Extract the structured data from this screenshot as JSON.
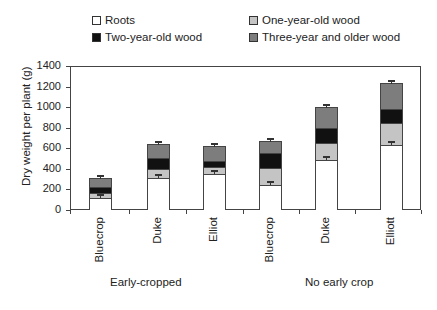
{
  "legend": {
    "items": [
      {
        "label": "Roots",
        "color": "#ffffff"
      },
      {
        "label": "One-year-old wood",
        "color": "#c4c4c4"
      },
      {
        "label": "Two-year-old wood",
        "color": "#111111"
      },
      {
        "label": "Three-year and older wood",
        "color": "#7d7d7d"
      }
    ]
  },
  "axis": {
    "ylabel": "Dry weight per plant (g)",
    "yticks": [
      "0",
      "200",
      "400",
      "600",
      "800",
      "1000",
      "1200",
      "1400"
    ]
  },
  "groups": [
    {
      "label": "Early-cropped"
    },
    {
      "label": "No early crop"
    }
  ],
  "categories": [
    "Bluecrop",
    "Duke",
    "Elliot",
    "Bluecrop",
    "Duke",
    "Elliott"
  ],
  "chart_data": {
    "type": "bar",
    "stacked": true,
    "title": "",
    "xlabel": "",
    "ylabel": "Dry weight per plant (g)",
    "ylim": [
      0,
      1400
    ],
    "yticks": [
      0,
      200,
      400,
      600,
      800,
      1000,
      1200,
      1400
    ],
    "grid": false,
    "legend_position": "top",
    "group_labels": [
      "Early-cropped",
      "No early crop"
    ],
    "categories": [
      "Bluecrop",
      "Duke",
      "Elliot",
      "Bluecrop",
      "Duke",
      "Elliott"
    ],
    "category_groups": [
      "Early-cropped",
      "Early-cropped",
      "Early-cropped",
      "No early crop",
      "No early crop",
      "No early crop"
    ],
    "series": [
      {
        "name": "Roots",
        "color": "#ffffff",
        "values": [
          115,
          310,
          350,
          240,
          490,
          630
        ]
      },
      {
        "name": "One-year-old wood",
        "color": "#c4c4c4",
        "values": [
          50,
          90,
          70,
          170,
          160,
          220
        ]
      },
      {
        "name": "Two-year-old wood",
        "color": "#111111",
        "values": [
          60,
          110,
          60,
          140,
          150,
          130
        ]
      },
      {
        "name": "Three-year and older wood",
        "color": "#7d7d7d",
        "values": [
          85,
          130,
          140,
          120,
          200,
          250
        ]
      }
    ],
    "totals": [
      310,
      640,
      620,
      670,
      1000,
      1230
    ],
    "error_bars": "shown on roots and total (small)"
  }
}
